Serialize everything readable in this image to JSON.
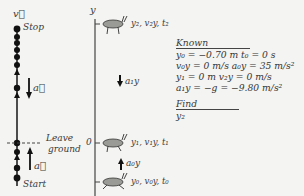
{
  "motion_diagram": {
    "velocity_label": "v⃗",
    "stop_label": "Stop",
    "start_label": "Start",
    "leave_ground_label": [
      "Leave",
      "ground"
    ],
    "accel_down_label": "a⃗",
    "accel_up_label": "a⃗"
  },
  "axis": {
    "label": "y",
    "zero_label": "0"
  },
  "positions": {
    "top": "y₂, v₂y, t₂",
    "middle": "y₁, v₁y, t₁",
    "bottom": "y₀, v₀y, t₀"
  },
  "accelerations": {
    "a1y": "a₁y",
    "a0y": "a₀y"
  },
  "known": {
    "heading": "Known",
    "rows": [
      "y₀ = −0.70 m   t₀ = 0 s",
      "v₀y = 0 m/s   a₀y = 35 m/s²",
      "y₁ = 0 m   v₂y = 0 m/s",
      "a₁y = −g = −9.80 m/s²"
    ]
  },
  "find": {
    "heading": "Find",
    "value": "y₂"
  },
  "colors": {
    "background": "#f4f4f2",
    "ink": "#222222",
    "bug_body": "#9a9a96"
  }
}
